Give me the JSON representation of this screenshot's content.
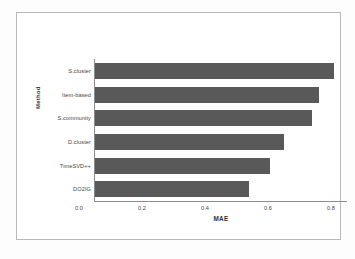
{
  "chart_data": {
    "type": "bar",
    "orientation": "horizontal",
    "title": "",
    "xlabel": "MAE",
    "ylabel": "Method",
    "categories": [
      "S.cluster",
      "Item-based",
      "S.community",
      "D.cluster",
      "TimeSVD++",
      "DO2IG"
    ],
    "values": [
      0.76,
      0.71,
      0.69,
      0.6,
      0.555,
      0.49
    ],
    "xlim": [
      0.0,
      0.8
    ],
    "xticks": [
      "0.0",
      "0.2",
      "0.4",
      "0.6",
      "0.8"
    ],
    "xtick_values": [
      0.0,
      0.2,
      0.4,
      0.6,
      0.8
    ],
    "grid": false,
    "legend": null,
    "bar_color": "#595959",
    "axis_color": "#8c8c8c",
    "frame_color": "#b9b9b9",
    "background": "#ffffff"
  }
}
